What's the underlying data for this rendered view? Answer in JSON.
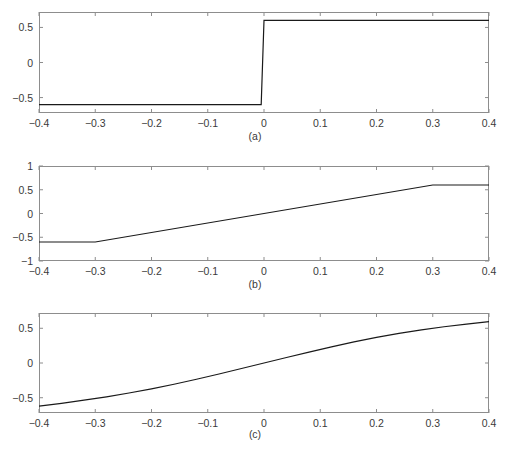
{
  "figure": {
    "background_color": "#ffffff",
    "axis_color": "#8d8d8d",
    "line_color": "#1a1a1a",
    "text_color": "#3a3a3a",
    "width": 510,
    "height": 456
  },
  "chart_data": [
    {
      "type": "line",
      "title": "",
      "caption": "(a)",
      "xlabel": "",
      "ylabel": "",
      "xlim": [
        -0.4,
        0.4
      ],
      "ylim": [
        -0.72,
        0.72
      ],
      "grid": false,
      "legend": null,
      "xticks": [
        -0.4,
        -0.3,
        -0.2,
        -0.1,
        0,
        0.1,
        0.2,
        0.3,
        0.4
      ],
      "xticklabels": [
        "-0.4",
        "-0.3",
        "-0.2",
        "-0.1",
        "0",
        "0.1",
        "0.2",
        "0.3",
        "0.4"
      ],
      "yticks": [
        0.5,
        0,
        -0.5
      ],
      "yticklabels": [
        "0.5",
        "0",
        "-0.5"
      ],
      "series": [
        {
          "name": "hard-limiter",
          "x": [
            -0.4,
            -0.005,
            -0.005,
            0.0,
            0.0,
            0.4
          ],
          "y": [
            -0.6,
            -0.6,
            -0.6,
            0.6,
            0.6,
            0.6
          ]
        }
      ]
    },
    {
      "type": "line",
      "title": "",
      "caption": "(b)",
      "xlabel": "",
      "ylabel": "",
      "xlim": [
        -0.4,
        0.4
      ],
      "ylim": [
        -1,
        1
      ],
      "grid": false,
      "legend": null,
      "xticks": [
        -0.4,
        -0.3,
        -0.2,
        -0.1,
        0,
        0.1,
        0.2,
        0.3,
        0.4
      ],
      "xticklabels": [
        "-0.4",
        "-0.3",
        "-0.2",
        "-0.1",
        "0",
        "0.1",
        "0.2",
        "0.3",
        "0.4"
      ],
      "yticks": [
        1,
        0.5,
        0,
        -0.5,
        -1
      ],
      "yticklabels": [
        "1",
        "0.5",
        "0",
        "-0.5",
        "-1"
      ],
      "series": [
        {
          "name": "piecewise-linear-saturation",
          "x": [
            -0.4,
            -0.3,
            0.3,
            0.4
          ],
          "y": [
            -0.6,
            -0.6,
            0.6,
            0.6
          ]
        }
      ]
    },
    {
      "type": "line",
      "title": "",
      "caption": "(c)",
      "xlabel": "",
      "ylabel": "",
      "xlim": [
        -0.4,
        0.4
      ],
      "ylim": [
        -0.72,
        0.72
      ],
      "grid": false,
      "legend": null,
      "xticks": [
        -0.4,
        -0.3,
        -0.2,
        -0.1,
        0,
        0.1,
        0.2,
        0.3,
        0.4
      ],
      "xticklabels": [
        "-0.4",
        "-0.3",
        "-0.2",
        "-0.1",
        "0",
        "0.1",
        "0.2",
        "0.3",
        "0.4"
      ],
      "yticks": [
        0.5,
        0,
        -0.5
      ],
      "yticklabels": [
        "0.5",
        "0",
        "-0.5"
      ],
      "series": [
        {
          "name": "smooth-sigmoid",
          "x": [
            -0.4,
            -0.36,
            -0.32,
            -0.28,
            -0.24,
            -0.2,
            -0.16,
            -0.12,
            -0.08,
            -0.04,
            0.0,
            0.04,
            0.08,
            0.12,
            0.16,
            0.2,
            0.24,
            0.28,
            0.32,
            0.36,
            0.4
          ],
          "y": [
            -0.62,
            -0.58,
            -0.535,
            -0.487,
            -0.432,
            -0.372,
            -0.306,
            -0.234,
            -0.158,
            -0.079,
            0.0,
            0.079,
            0.157,
            0.232,
            0.303,
            0.368,
            0.427,
            0.478,
            0.522,
            0.561,
            0.597
          ]
        }
      ]
    }
  ]
}
